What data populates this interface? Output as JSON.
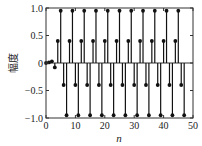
{
  "chart_data": {
    "type": "stem",
    "title": "",
    "xlabel": "n",
    "ylabel": "幅度",
    "xlim": [
      0,
      50
    ],
    "ylim": [
      -1.0,
      1.0
    ],
    "xticks": [
      0,
      10,
      20,
      30,
      40,
      50
    ],
    "xtick_labels": [
      "0",
      "10",
      "20",
      "30",
      "40",
      "50"
    ],
    "yticks": [
      -1.0,
      -0.5,
      0,
      0.5,
      1.0
    ],
    "ytick_labels": [
      "−1.0",
      "−0.5",
      "0",
      "0.5",
      "1.0"
    ],
    "grid": false,
    "legend": null,
    "x": [
      0,
      1,
      2,
      3,
      4,
      5,
      6,
      7,
      8,
      9,
      10,
      11,
      12,
      13,
      14,
      15,
      16,
      17,
      18,
      19,
      20,
      21,
      22,
      23,
      24,
      25,
      26,
      27,
      28,
      29,
      30,
      31,
      32,
      33,
      34,
      35,
      36,
      37,
      38,
      39,
      40,
      41,
      42,
      43,
      44,
      45,
      46,
      47
    ],
    "values": [
      0.0,
      0.01,
      0.03,
      -0.08,
      0.4,
      0.95,
      -0.4,
      -0.95,
      0.4,
      0.95,
      -0.4,
      -0.95,
      0.4,
      0.95,
      -0.4,
      -0.95,
      0.4,
      0.95,
      -0.4,
      -0.95,
      0.4,
      0.95,
      -0.4,
      -0.95,
      0.4,
      0.95,
      -0.4,
      -0.95,
      0.4,
      0.95,
      -0.4,
      -0.95,
      0.4,
      0.95,
      -0.4,
      -0.95,
      0.4,
      0.95,
      -0.4,
      -0.95,
      0.4,
      0.95,
      -0.4,
      -0.95,
      0.4,
      0.95,
      -0.4,
      -0.95
    ],
    "colors": {
      "stem": "#111111",
      "axis": "#333333",
      "background": "#ffffff"
    }
  }
}
